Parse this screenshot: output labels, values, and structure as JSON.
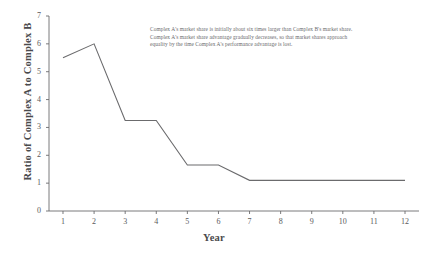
{
  "chart_data": {
    "type": "line",
    "title": "",
    "xlabel": "Year",
    "ylabel": "Ratio of Complex A to Complex B",
    "x": [
      1,
      2,
      3,
      4,
      5,
      6,
      7,
      8,
      9,
      10,
      11,
      12
    ],
    "values": [
      5.5,
      6.0,
      3.25,
      3.25,
      1.65,
      1.65,
      1.1,
      1.1,
      1.1,
      1.1,
      1.1,
      1.1
    ],
    "series": [
      {
        "name": "Ratio of Complex A to Complex B",
        "values": [
          5.5,
          6.0,
          3.25,
          3.25,
          1.65,
          1.65,
          1.1,
          1.1,
          1.1,
          1.1,
          1.1,
          1.1
        ]
      }
    ],
    "xlim": [
      0.55,
      12.45
    ],
    "ylim": [
      0,
      7
    ],
    "xticks": [
      "1",
      "2",
      "3",
      "4",
      "5",
      "6",
      "7",
      "8",
      "9",
      "10",
      "11",
      "12"
    ],
    "yticks": [
      "0",
      "1",
      "2",
      "3",
      "4",
      "5",
      "6",
      "7"
    ],
    "grid": false,
    "legend": "none",
    "line_color": "#6b6b6d",
    "axis_color": "#6b6b6d",
    "annotations": [
      "Complex A's market share is initially about six times larger than Complex B's market share.",
      "Complex A's market share advantage gradually decreases, so that market shares approach",
      "equality by the time Complex A's performance advantage is lost."
    ]
  }
}
